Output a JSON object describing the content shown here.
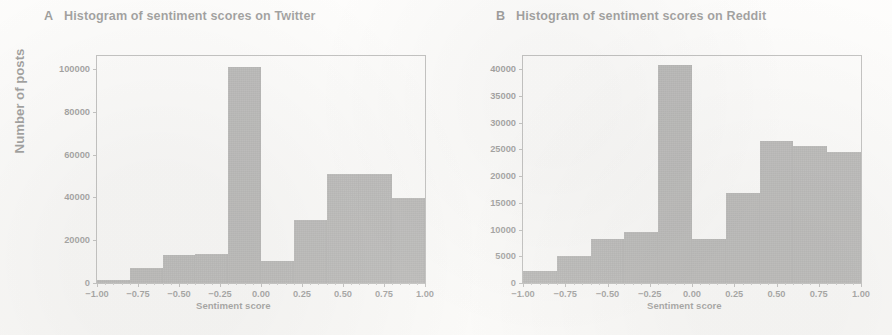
{
  "figure": {
    "background": "#ffffff",
    "bar_color": "#555555",
    "axis_color": "#6f6f6f",
    "shared_ylabel": "Number of posts"
  },
  "panels": [
    {
      "letter": "A",
      "title": "Histogram of sentiment scores on Twitter",
      "xlabel": "Sentiment score",
      "ylabel": "Number of posts",
      "ytick_labels": [
        "0",
        "20000",
        "40000",
        "60000",
        "80000",
        "100000"
      ],
      "xtick_labels": [
        "−1.00",
        "−0.75",
        "−0.50",
        "−0.25",
        "0.00",
        "0.25",
        "0.50",
        "0.75",
        "1.00"
      ]
    },
    {
      "letter": "B",
      "title": "Histogram of sentiment scores on Reddit",
      "xlabel": "Sentiment score",
      "ylabel": "Number of posts",
      "ytick_labels": [
        "0",
        "5000",
        "10000",
        "15000",
        "20000",
        "25000",
        "30000",
        "35000",
        "40000"
      ],
      "xtick_labels": [
        "−1.00",
        "−0.75",
        "−0.50",
        "−0.25",
        "0.00",
        "0.25",
        "0.50",
        "0.75",
        "1.00"
      ]
    }
  ],
  "chart_data": [
    {
      "type": "bar",
      "subplot": "A",
      "title": "Histogram of sentiment scores on Twitter",
      "xlabel": "Sentiment score",
      "ylabel": "Number of posts",
      "xlim": [
        -1.0,
        1.0
      ],
      "ylim": [
        0,
        106000
      ],
      "yticks": [
        0,
        20000,
        40000,
        60000,
        80000,
        100000
      ],
      "xticks": [
        -1.0,
        -0.75,
        -0.5,
        -0.25,
        0.0,
        0.25,
        0.5,
        0.75,
        1.0
      ],
      "grid": false,
      "legend": null,
      "bin_edges": [
        -1.0,
        -0.8,
        -0.6,
        -0.4,
        -0.2,
        0.0,
        0.2,
        0.4,
        0.6,
        0.8,
        1.0
      ],
      "bin_centers": [
        -0.9,
        -0.7,
        -0.5,
        -0.3,
        -0.1,
        0.1,
        0.3,
        0.5,
        0.7,
        0.9
      ],
      "values": [
        1500,
        7000,
        13000,
        13500,
        101000,
        10500,
        29500,
        51000,
        51000,
        39500
      ]
    },
    {
      "type": "bar",
      "subplot": "B",
      "title": "Histogram of sentiment scores on Reddit",
      "xlabel": "Sentiment score",
      "ylabel": "Number of posts",
      "xlim": [
        -1.0,
        1.0
      ],
      "ylim": [
        0,
        42500
      ],
      "yticks": [
        0,
        5000,
        10000,
        15000,
        20000,
        25000,
        30000,
        35000,
        40000
      ],
      "xticks": [
        -1.0,
        -0.75,
        -0.5,
        -0.25,
        0.0,
        0.25,
        0.5,
        0.75,
        1.0
      ],
      "grid": false,
      "legend": null,
      "bin_edges": [
        -1.0,
        -0.8,
        -0.6,
        -0.4,
        -0.2,
        0.0,
        0.2,
        0.4,
        0.6,
        0.8,
        1.0
      ],
      "bin_centers": [
        -0.9,
        -0.7,
        -0.5,
        -0.3,
        -0.1,
        0.1,
        0.3,
        0.5,
        0.7,
        0.9
      ],
      "values": [
        2200,
        5000,
        8300,
        9500,
        40800,
        8200,
        16900,
        26600,
        25700,
        24600
      ]
    }
  ]
}
